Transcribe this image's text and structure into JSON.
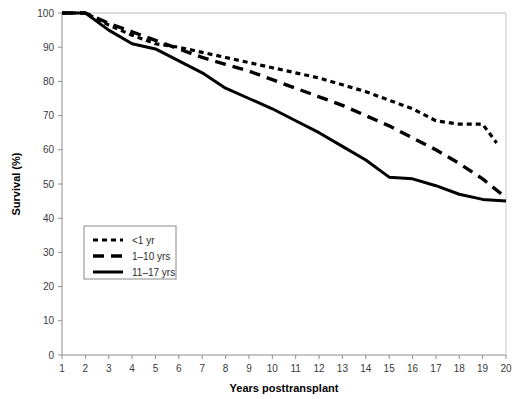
{
  "chart_data": {
    "type": "line",
    "title": "",
    "xlabel": "Years posttransplant",
    "ylabel": "Survival (%)",
    "xlim": [
      1,
      20
    ],
    "ylim": [
      0,
      100
    ],
    "grid": false,
    "legend_position": "inner-left",
    "x_ticks": [
      "1",
      "2",
      "3",
      "4",
      "5",
      "6",
      "7",
      "8",
      "9",
      "10",
      "11",
      "12",
      "13",
      "14",
      "15",
      "16",
      "17",
      "18",
      "19",
      "20"
    ],
    "y_ticks": [
      "0",
      "10",
      "20",
      "30",
      "40",
      "50",
      "60",
      "70",
      "80",
      "90",
      "100"
    ],
    "x": [
      1,
      2,
      3,
      4,
      5,
      6,
      7,
      8,
      9,
      10,
      11,
      12,
      13,
      14,
      15,
      16,
      17,
      18,
      19,
      20
    ],
    "series": [
      {
        "name": "<1 yr",
        "style": "dotted",
        "color": "#000000",
        "values": [
          100,
          100,
          96.5,
          93.5,
          91,
          90,
          88.5,
          87,
          85.5,
          84,
          82.5,
          81,
          79,
          77,
          74.5,
          72,
          68.5,
          67.5,
          67.5,
          null
        ],
        "end_value": 62,
        "end_x": 19.6
      },
      {
        "name": "1–10 yrs",
        "style": "dashed",
        "color": "#000000",
        "values": [
          100,
          100,
          97,
          94.5,
          92,
          89.5,
          87,
          85,
          83,
          80.5,
          78,
          75.5,
          73,
          70,
          67,
          63.5,
          60,
          56,
          51.5,
          46
        ],
        "end_value": 46,
        "end_x": 19.4
      },
      {
        "name": "11–17 yrs",
        "style": "solid",
        "color": "#000000",
        "values": [
          100,
          100,
          95,
          91,
          89.5,
          86,
          82.5,
          78,
          75,
          72,
          68.5,
          65,
          61,
          57,
          52,
          51.5,
          49.5,
          47,
          45.5,
          45
        ],
        "end_value": 45,
        "end_x": 20
      }
    ]
  },
  "legend": {
    "items": [
      {
        "label": "<1 yr",
        "style": "dotted"
      },
      {
        "label": "1–10 yrs",
        "style": "dashed"
      },
      {
        "label": "11–17 yrs",
        "style": "solid"
      }
    ]
  }
}
